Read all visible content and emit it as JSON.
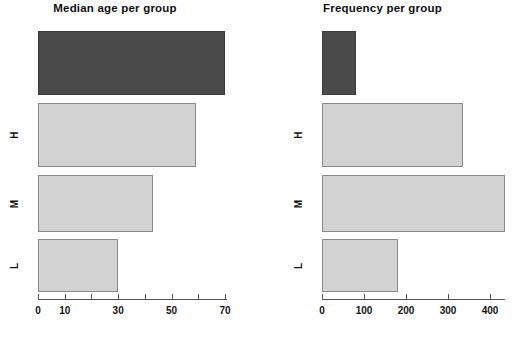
{
  "page": {
    "background": "#ffffff",
    "width": 515,
    "height": 340
  },
  "colors": {
    "bar_dark": "#4a4a4a",
    "bar_light": "#d2d2d2",
    "bar_border": "#7d7d7d",
    "axis": "#555555",
    "text": "#131313"
  },
  "charts": [
    {
      "id": "median-age-per-group",
      "title": "Median age per group",
      "panel": "left"
    },
    {
      "id": "frequency-per-group",
      "title": "Frequency per group",
      "panel": "right"
    }
  ],
  "chart_data": [
    {
      "type": "bar",
      "orientation": "horizontal",
      "title": "Median age per group",
      "xlabel": "",
      "ylabel": "",
      "categories": [
        "",
        "H",
        "M",
        "L"
      ],
      "values": [
        70,
        59,
        43,
        30
      ],
      "shades": [
        "dark",
        "light",
        "light",
        "light"
      ],
      "xlim": [
        0,
        72
      ],
      "xticks": [
        0,
        10,
        20,
        30,
        40,
        50,
        60,
        70
      ],
      "xticklabels": [
        "0",
        "10",
        "",
        "30",
        "",
        "50",
        "",
        "70"
      ],
      "grid": false,
      "legend": false
    },
    {
      "type": "bar",
      "orientation": "horizontal",
      "title": "Frequency per group",
      "xlabel": "",
      "ylabel": "",
      "categories": [
        "",
        "H",
        "M",
        "L"
      ],
      "values": [
        80,
        335,
        435,
        180
      ],
      "shades": [
        "dark",
        "light",
        "light",
        "light"
      ],
      "xlim": [
        0,
        440
      ],
      "xticks": [
        0,
        100,
        200,
        300,
        400
      ],
      "xticklabels": [
        "0",
        "100",
        "200",
        "300",
        "400"
      ],
      "grid": false,
      "legend": false
    }
  ],
  "axes": {
    "left": {
      "labels": [
        "0",
        "10",
        "30",
        "50",
        "70"
      ],
      "label_values": [
        0,
        10,
        30,
        50,
        70
      ]
    },
    "right": {
      "labels": [
        "0",
        "100",
        "200",
        "300",
        "400"
      ],
      "label_values": [
        0,
        100,
        200,
        300,
        400
      ]
    }
  },
  "y_labels": {
    "left": [
      "H",
      "M",
      "L"
    ],
    "right": [
      "H",
      "M",
      "L"
    ]
  }
}
